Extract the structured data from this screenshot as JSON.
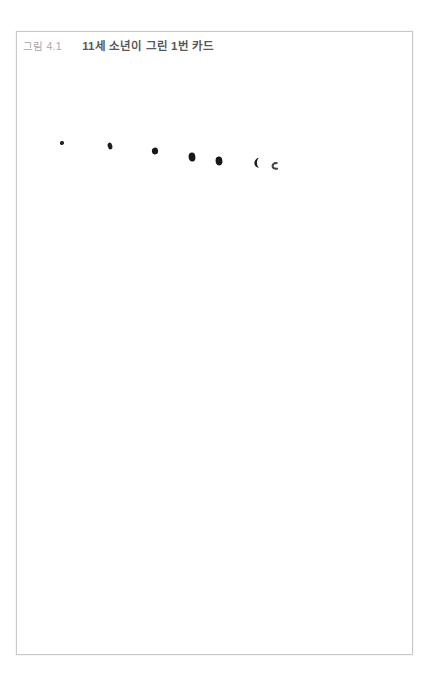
{
  "page": {
    "background_color": "#ffffff",
    "header_fragment": "― ― ―"
  },
  "figure": {
    "number_label": "그림 4.1",
    "title": "11세 소년이 그린 1번 카드",
    "border_color": "#c9c9c9",
    "number_color": "#a8a8a8",
    "title_color": "#58585a",
    "card_background": "#ffffff"
  },
  "drawing": {
    "description": "손그림 잌크 점 7개",
    "ink_color": "#111111",
    "marks": [
      {
        "name": "ink-dot-1",
        "cx": 62,
        "cy": 143,
        "rx": 2.1,
        "ry": 2.0,
        "rotate": -18,
        "opacity": 0.92,
        "shape": "dot"
      },
      {
        "name": "ink-dot-2",
        "cx": 110,
        "cy": 146,
        "rx": 2.3,
        "ry": 3.4,
        "rotate": -14,
        "opacity": 0.95,
        "shape": "dot"
      },
      {
        "name": "ink-dot-3",
        "cx": 155,
        "cy": 151,
        "rx": 3.1,
        "ry": 3.4,
        "rotate": -8,
        "opacity": 0.97,
        "shape": "dot"
      },
      {
        "name": "ink-dot-4",
        "cx": 192,
        "cy": 157,
        "rx": 3.4,
        "ry": 4.5,
        "rotate": -6,
        "opacity": 0.97,
        "shape": "dot"
      },
      {
        "name": "ink-dot-5",
        "cx": 219,
        "cy": 161,
        "rx": 3.4,
        "ry": 4.4,
        "rotate": -5,
        "opacity": 0.97,
        "shape": "dot"
      },
      {
        "name": "ink-crescent-6",
        "cx": 257,
        "cy": 163,
        "rx": 3.6,
        "ry": 5.2,
        "rotate": -10,
        "opacity": 0.97,
        "shape": "crescent"
      },
      {
        "name": "ink-curve-7",
        "cx": 274,
        "cy": 166,
        "rx": 2.8,
        "ry": 3.4,
        "rotate": -4,
        "opacity": 0.8,
        "shape": "c-curve"
      }
    ]
  }
}
